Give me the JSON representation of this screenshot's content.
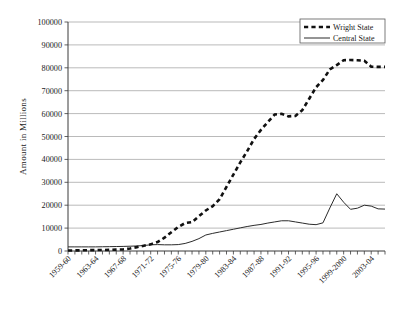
{
  "chart_data": {
    "type": "line",
    "title": "",
    "xlabel": "",
    "ylabel": "Amount  in Millions",
    "ylim": [
      0,
      100000
    ],
    "ytick_values": [
      0,
      10000,
      20000,
      30000,
      40000,
      50000,
      60000,
      70000,
      80000,
      90000,
      100000
    ],
    "ytick_labels": [
      "0",
      "10000",
      "20000",
      "30000",
      "40000",
      "50000",
      "60000",
      "70000",
      "80000",
      "90000",
      "100000"
    ],
    "grid": true,
    "legend_position": "top-right",
    "categories": [
      "1959-60",
      "1960-61",
      "1961-62",
      "1962-63",
      "1963-64",
      "1964-65",
      "1965-66",
      "1966-67",
      "1967-68",
      "1968-69",
      "1969-70",
      "1970-71",
      "1971-72",
      "1972-73",
      "1973-74",
      "1974-75",
      "1975-76",
      "1976-77",
      "1977-78",
      "1978-79",
      "1979-80",
      "1980-81",
      "1981-82",
      "1982-83",
      "1983-84",
      "1984-85",
      "1985-86",
      "1986-87",
      "1987-88",
      "1988-89",
      "1989-90",
      "1990-91",
      "1991-92",
      "1992-93",
      "1993-94",
      "1994-95",
      "1995-96",
      "1996-97",
      "1997-98",
      "1998-99",
      "1999-2000",
      "2000-01",
      "2001-02",
      "2002-03",
      "2003-04",
      "2004-05",
      "2005-06"
    ],
    "xtick_labels": [
      "1959-60",
      "1963-64",
      "1967-68",
      "1971-72",
      "1975-76",
      "1979-80",
      "1983-84",
      "1987-88",
      "1991-92",
      "1995-96",
      "1999-2000",
      "2003-04"
    ],
    "xtick_label_interval": 4,
    "series": [
      {
        "name": "Wright State",
        "style": "dashed",
        "color": "#111111",
        "values": [
          200,
          250,
          300,
          350,
          400,
          450,
          500,
          600,
          700,
          1100,
          1700,
          2300,
          2900,
          3900,
          5800,
          8200,
          10500,
          12200,
          12600,
          15200,
          17700,
          19600,
          22600,
          28000,
          33400,
          38700,
          43600,
          48900,
          52900,
          56300,
          59600,
          59900,
          58800,
          59000,
          61500,
          66500,
          71500,
          74700,
          79300,
          81200,
          83300,
          83400,
          83300,
          83100,
          80500,
          80400,
          80400
        ]
      },
      {
        "name": "Central State",
        "style": "solid",
        "color": "#2b2b2b",
        "values": [
          1800,
          1800,
          1800,
          1800,
          1800,
          1850,
          1900,
          1950,
          2000,
          2100,
          2200,
          2400,
          2700,
          2800,
          2700,
          2700,
          2800,
          3300,
          4200,
          5400,
          7000,
          7700,
          8300,
          8900,
          9500,
          10100,
          10700,
          11200,
          11600,
          12200,
          12700,
          13200,
          13200,
          12700,
          12200,
          11700,
          11500,
          12300,
          18800,
          25000,
          21300,
          18200,
          18700,
          20000,
          19600,
          18400,
          18300
        ]
      }
    ]
  },
  "legend": {
    "items": [
      {
        "label": "Wright State"
      },
      {
        "label": "Central State"
      }
    ]
  }
}
